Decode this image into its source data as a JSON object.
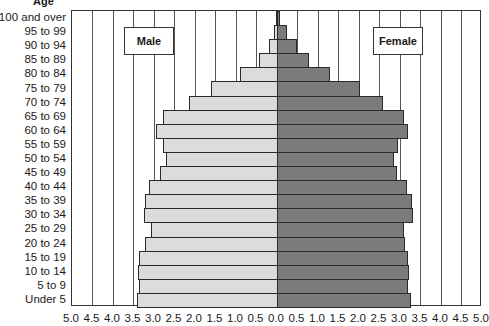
{
  "chart_data": {
    "type": "bar",
    "orientation": "horizontal",
    "subtype": "population-pyramid",
    "title": "",
    "ylabel": "Age",
    "xlabel": "",
    "categories": [
      "100 and over",
      "95 to 99",
      "90 to 94",
      "85 to 89",
      "80 to 84",
      "75 to 79",
      "70 to 74",
      "65 to 69",
      "60 to 64",
      "55 to 59",
      "50 to 54",
      "45 to 49",
      "40 to 44",
      "35 to 39",
      "30 to 34",
      "25 to 29",
      "20 to 24",
      "15 to 19",
      "10 to 14",
      "5 to 9",
      "Under 5"
    ],
    "series": [
      {
        "name": "Male",
        "color": "#dcdcdc",
        "side": "left",
        "values": [
          0.03,
          0.08,
          0.2,
          0.45,
          0.9,
          1.6,
          2.15,
          2.78,
          2.95,
          2.78,
          2.7,
          2.85,
          3.12,
          3.22,
          3.25,
          3.07,
          3.23,
          3.37,
          3.38,
          3.37,
          3.42
        ]
      },
      {
        "name": "Female",
        "color": "#7b7b7b",
        "side": "right",
        "values": [
          0.07,
          0.25,
          0.48,
          0.78,
          1.3,
          2.03,
          2.58,
          3.1,
          3.2,
          2.95,
          2.85,
          2.92,
          3.18,
          3.3,
          3.32,
          3.1,
          3.12,
          3.2,
          3.22,
          3.2,
          3.27
        ]
      }
    ],
    "xticks": [
      "5.0",
      "4.5",
      "4.0",
      "3.5",
      "3.0",
      "2.5",
      "2.0",
      "1.5",
      "1.0",
      "0.5",
      "0.0",
      "0.5",
      "1.0",
      "1.5",
      "2.0",
      "2.5",
      "3.0",
      "3.5",
      "4.0",
      "4.5",
      "5.0"
    ],
    "xlim": [
      -5.0,
      5.0
    ],
    "grid": true,
    "legend": [
      "Male",
      "Female"
    ]
  },
  "labels": {
    "age_title": "Age",
    "male": "Male",
    "female": "Female"
  }
}
